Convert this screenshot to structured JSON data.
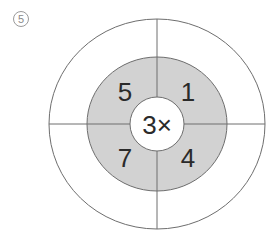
{
  "problem_label": "5",
  "center": {
    "text": "3×"
  },
  "segments": [
    {
      "position": "top-left",
      "value": "5"
    },
    {
      "position": "top-right",
      "value": "1"
    },
    {
      "position": "bottom-left",
      "value": "7"
    },
    {
      "position": "bottom-right",
      "value": "4"
    }
  ],
  "colors": {
    "ring_fill": "#d2d2d2",
    "line": "#6e6e6e",
    "background": "#ffffff"
  }
}
